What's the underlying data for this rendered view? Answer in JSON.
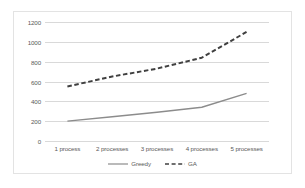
{
  "chart_data": {
    "type": "line",
    "title": "",
    "xlabel": "",
    "ylabel": "",
    "categories": [
      "1 process",
      "2 processes",
      "3 processes",
      "4 processes",
      "5 processes"
    ],
    "series": [
      {
        "name": "Greedy",
        "style": "solid",
        "color": "#8c8c8c",
        "values": [
          200,
          245,
          290,
          340,
          480
        ]
      },
      {
        "name": "GA",
        "style": "dashed",
        "color": "#404040",
        "values": [
          550,
          650,
          730,
          840,
          1100
        ]
      }
    ],
    "ylim": [
      0,
      1200
    ],
    "yticks": [
      0,
      200,
      400,
      600,
      800,
      1000,
      1200
    ],
    "ytick_labels": [
      "0",
      "200",
      "400",
      "600",
      "800",
      "1000",
      "1200"
    ],
    "grid": true,
    "legend_position": "bottom-center",
    "border_color": "#e3e3e3",
    "grid_color": "#d9d9d9",
    "text_color": "#595959",
    "background": "#ffffff"
  },
  "legend": {
    "items": [
      {
        "label": "Greedy"
      },
      {
        "label": "GA"
      }
    ]
  }
}
